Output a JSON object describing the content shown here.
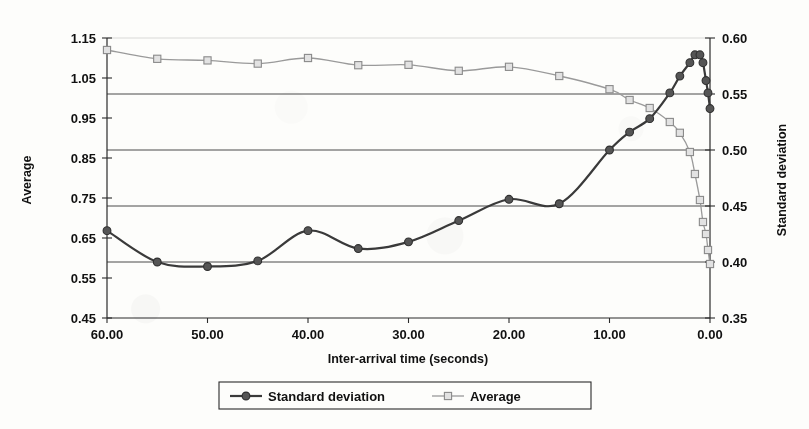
{
  "chart_data": {
    "type": "line",
    "title": "",
    "xlabel": "Inter-arrival time (seconds)",
    "ylabel": "Average",
    "y2label": "Standard deviation",
    "xlim": [
      60,
      0
    ],
    "x_reversed": true,
    "ylim": [
      0.45,
      1.15
    ],
    "y2lim": [
      0.35,
      0.6
    ],
    "xticks": [
      "60.00",
      "50.00",
      "40.00",
      "30.00",
      "20.00",
      "10.00",
      "0.00"
    ],
    "xtick_values": [
      60,
      50,
      40,
      30,
      20,
      10,
      0
    ],
    "yticks": [
      "0.45",
      "0.55",
      "0.65",
      "0.75",
      "0.85",
      "0.95",
      "1.05",
      "1.15"
    ],
    "ytick_values": [
      0.45,
      0.55,
      0.65,
      0.75,
      0.85,
      0.95,
      1.05,
      1.15
    ],
    "y2ticks": [
      "0.35",
      "0.40",
      "0.45",
      "0.50",
      "0.55",
      "0.60"
    ],
    "y2tick_values": [
      0.35,
      0.4,
      0.45,
      0.5,
      0.55,
      0.6
    ],
    "grid": "horizontal-on-secondary-axis",
    "gridline_values_y2": [
      0.4,
      0.45,
      0.5,
      0.55,
      0.6
    ],
    "legend_position": "bottom",
    "series": [
      {
        "name": "Standard deviation",
        "axis": "right",
        "marker": "circle",
        "color": "#555555",
        "line_color": "#3a3a3a",
        "x": [
          60,
          55,
          50,
          45,
          40,
          35,
          30,
          25,
          20,
          15,
          10,
          8,
          6,
          4,
          3,
          2,
          1.5,
          1,
          0.7,
          0.4,
          0.2,
          0
        ],
        "values": [
          0.428,
          0.4,
          0.396,
          0.401,
          0.428,
          0.412,
          0.418,
          0.437,
          0.456,
          0.452,
          0.5,
          0.516,
          0.528,
          0.551,
          0.566,
          0.578,
          0.585,
          0.585,
          0.578,
          0.562,
          0.551,
          0.537
        ]
      },
      {
        "name": "Average",
        "axis": "left",
        "marker": "square",
        "color": "#cfcfcf",
        "line_color": "#9a9a9a",
        "x": [
          60,
          55,
          50,
          45,
          40,
          35,
          30,
          25,
          20,
          15,
          10,
          8,
          6,
          4,
          3,
          2,
          1.5,
          1,
          0.7,
          0.4,
          0.2,
          0
        ],
        "values": [
          1.12,
          1.098,
          1.094,
          1.086,
          1.1,
          1.082,
          1.083,
          1.068,
          1.078,
          1.055,
          1.022,
          0.995,
          0.975,
          0.94,
          0.913,
          0.865,
          0.81,
          0.745,
          0.69,
          0.66,
          0.62,
          0.585
        ]
      }
    ]
  },
  "legend": {
    "items": [
      {
        "label": "Standard deviation",
        "marker": "circle"
      },
      {
        "label": "Average",
        "marker": "square"
      }
    ]
  }
}
